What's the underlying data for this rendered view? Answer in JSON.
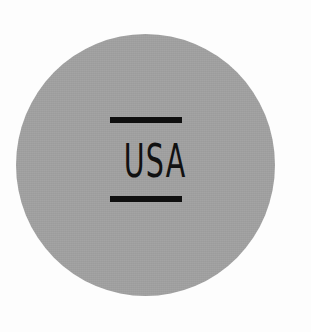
{
  "badge": {
    "text": "USA",
    "fill_color": "#a1a1a1",
    "ink_color": "#111111",
    "background_color": "#fdfdfd",
    "shape": "circle"
  }
}
